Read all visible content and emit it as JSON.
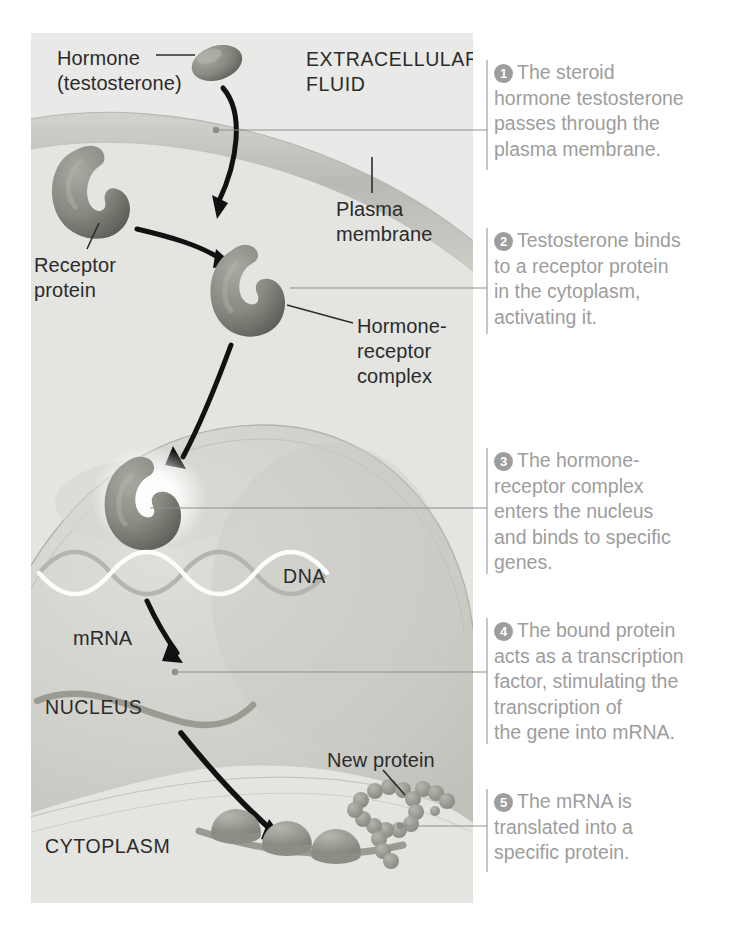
{
  "figure": {
    "panel_bg": "#e9e9e7",
    "callout_color": "#9d9d9d",
    "label_color": "#2b2b2b"
  },
  "diagram_labels": {
    "hormone": "Hormone\n(testosterone)",
    "extracellular_fluid": "EXTRACELLULAR\nFLUID",
    "receptor_protein": "Receptor\nprotein",
    "plasma_membrane": "Plasma\nmembrane",
    "hormone_receptor_complex": "Hormone-\nreceptor\ncomplex",
    "dna": "DNA",
    "mrna": "mRNA",
    "nucleus": "NUCLEUS",
    "new_protein": "New protein",
    "cytoplasm": "CYTOPLASM"
  },
  "callouts": [
    {
      "number": "1",
      "text": "The steroid\nhormone testosterone\npasses through the\nplasma membrane."
    },
    {
      "number": "2",
      "text": "Testosterone binds\nto a receptor protein\nin the cytoplasm,\nactivating it."
    },
    {
      "number": "3",
      "text": "The hormone-\nreceptor complex\nenters the nucleus\nand binds to specific\ngenes."
    },
    {
      "number": "4",
      "text": "The bound protein\nacts as a transcription\nfactor, stimulating the\ntranscription of\nthe gene into mRNA."
    },
    {
      "number": "5",
      "text": "The mRNA is\ntranslated into a\nspecific protein."
    }
  ],
  "icons": {
    "hormone": "hormone-molecule-icon",
    "receptor": "receptor-protein-icon",
    "complex": "hormone-receptor-complex-icon",
    "dna": "dna-double-helix-icon",
    "mrna": "mrna-strand-icon",
    "ribosome": "ribosome-icon",
    "polypeptide": "new-protein-chain-icon"
  }
}
